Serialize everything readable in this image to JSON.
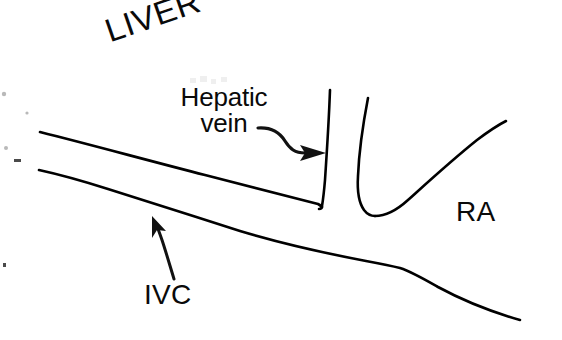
{
  "figure": {
    "kind": "anatomical-line-drawing",
    "background_color": "#ffffff",
    "ink_color": "#000000",
    "width": 562,
    "height": 340
  },
  "labels": {
    "liver": "LIVER",
    "hepatic_vein_line1": "Hepatic",
    "hepatic_vein_line2": "vein",
    "ivc": "IVC",
    "ra": "RA"
  },
  "pointers": {
    "hepatic_vein_arrow": "curved-arrow-right",
    "ivc_arrow": "curved-arrow-up-left"
  },
  "structures": {
    "ivc_upper_wall": "upper wall of inferior vena cava",
    "ivc_lower_wall": "lower wall of inferior vena cava",
    "hepatic_vein_left_wall": "left wall of hepatic vein",
    "hepatic_vein_right_wall": "right wall of hepatic vein",
    "right_atrium_wall": "right atrial border"
  }
}
